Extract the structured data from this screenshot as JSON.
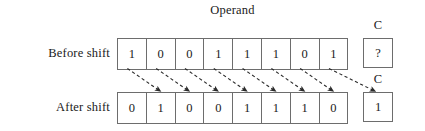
{
  "diagram": {
    "title": "Operand",
    "rows": [
      {
        "id": "before",
        "label": "Before shift",
        "bits": [
          "1",
          "0",
          "0",
          "1",
          "1",
          "1",
          "0",
          "1"
        ],
        "carry_label": "C",
        "carry_value": "?"
      },
      {
        "id": "after",
        "label": "After shift",
        "bits": [
          "0",
          "1",
          "0",
          "0",
          "1",
          "1",
          "1",
          "0"
        ],
        "carry_label": "C",
        "carry_value": "1"
      }
    ],
    "colors": {
      "background": "#ffffff",
      "box_border": "#6d6d6d",
      "text": "#1a1a1a",
      "arrow": "#2b2b2b"
    },
    "arrows": {
      "count": 8,
      "style": "dashed",
      "direction": "down-right",
      "description": "Each operand bit moves one position to the right; the rightmost bit moves into the carry C."
    }
  }
}
